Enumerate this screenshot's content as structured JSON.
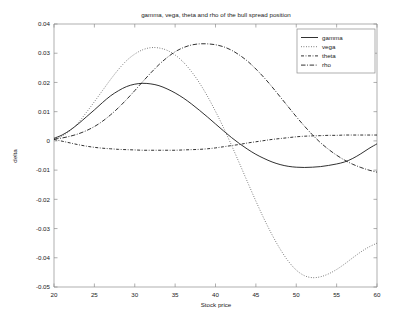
{
  "chart_data": {
    "type": "line",
    "title": "gamma, vega, theta and rho of the bull spread position",
    "xlabel": "Stock price",
    "ylabel": "delta",
    "xlim": [
      20,
      60
    ],
    "ylim": [
      -0.05,
      0.04
    ],
    "xticks": [
      20,
      25,
      30,
      35,
      40,
      45,
      50,
      55,
      60
    ],
    "xticklabels": [
      "20",
      "25",
      "30",
      "35",
      "40",
      "45",
      "50",
      "55",
      "60"
    ],
    "yticks": [
      -0.05,
      -0.04,
      -0.03,
      -0.02,
      -0.01,
      0,
      0.01,
      0.02,
      0.03,
      0.04
    ],
    "yticklabels": [
      "-0.05",
      "-0.04",
      "-0.03",
      "-0.02",
      "-0.01",
      "0",
      "0.01",
      "0.02",
      "0.03",
      "0.04"
    ],
    "grid": false,
    "legend_position": "upper right",
    "x": [
      20,
      21,
      22,
      23,
      24,
      25,
      26,
      27,
      28,
      29,
      30,
      31,
      32,
      33,
      34,
      35,
      36,
      37,
      38,
      39,
      40,
      41,
      42,
      43,
      44,
      45,
      46,
      47,
      48,
      49,
      50,
      51,
      52,
      53,
      54,
      55,
      56,
      57,
      58,
      59,
      60
    ],
    "series": [
      {
        "name": "gamma",
        "style": "solid",
        "color": "#1a1a1a",
        "values": [
          0.0009,
          0.002,
          0.0037,
          0.0058,
          0.0082,
          0.0106,
          0.0131,
          0.0154,
          0.0172,
          0.0186,
          0.0194,
          0.0197,
          0.0195,
          0.0189,
          0.0178,
          0.0164,
          0.0147,
          0.0127,
          0.0105,
          0.0082,
          0.0058,
          0.0034,
          0.0011,
          -0.001,
          -0.0029,
          -0.0046,
          -0.006,
          -0.0072,
          -0.0081,
          -0.0087,
          -0.009,
          -0.0091,
          -0.009,
          -0.0088,
          -0.0084,
          -0.0079,
          -0.0072,
          -0.006,
          -0.0044,
          -0.0026,
          -0.001
        ]
      },
      {
        "name": "vega",
        "style": "dotted",
        "color": "#4d4d4d",
        "values": [
          0.0006,
          0.0017,
          0.0035,
          0.0062,
          0.0097,
          0.0134,
          0.0172,
          0.021,
          0.0245,
          0.0275,
          0.0297,
          0.0312,
          0.0319,
          0.0318,
          0.031,
          0.0294,
          0.027,
          0.0238,
          0.0199,
          0.0153,
          0.0101,
          0.0045,
          -0.0016,
          -0.0079,
          -0.0143,
          -0.0206,
          -0.0266,
          -0.0321,
          -0.037,
          -0.0411,
          -0.0442,
          -0.0461,
          -0.0468,
          -0.0465,
          -0.0455,
          -0.044,
          -0.0421,
          -0.04,
          -0.038,
          -0.0363,
          -0.035
        ]
      },
      {
        "name": "theta",
        "style": "dashdot-short",
        "color": "#1a1a1a",
        "values": [
          0.0005,
          -0.0001,
          -0.0007,
          -0.0013,
          -0.0018,
          -0.0022,
          -0.0025,
          -0.0027,
          -0.0029,
          -0.003,
          -0.0031,
          -0.0032,
          -0.0032,
          -0.0032,
          -0.0032,
          -0.0032,
          -0.0031,
          -0.003,
          -0.0029,
          -0.0027,
          -0.0024,
          -0.002,
          -0.0016,
          -0.0012,
          -0.0007,
          -0.0003,
          0.0001,
          0.0005,
          0.0008,
          0.0011,
          0.0014,
          0.0016,
          0.0017,
          0.0018,
          0.0019,
          0.0019,
          0.002,
          0.002,
          0.002,
          0.002,
          0.002
        ]
      },
      {
        "name": "rho",
        "style": "dashdot-long",
        "color": "#1a1a1a",
        "values": [
          0.0006,
          0.001,
          0.0016,
          0.0024,
          0.0035,
          0.0049,
          0.0067,
          0.0089,
          0.0114,
          0.0142,
          0.0172,
          0.0203,
          0.0233,
          0.0261,
          0.0285,
          0.0305,
          0.0319,
          0.0328,
          0.0332,
          0.0332,
          0.0329,
          0.0322,
          0.031,
          0.0293,
          0.0272,
          0.0246,
          0.0217,
          0.0185,
          0.0151,
          0.0117,
          0.0083,
          0.0051,
          0.0021,
          -0.0006,
          -0.0029,
          -0.0049,
          -0.0066,
          -0.008,
          -0.0091,
          -0.01,
          -0.0107
        ]
      }
    ]
  },
  "legend": {
    "items": [
      {
        "label": "gamma"
      },
      {
        "label": "vega"
      },
      {
        "label": "theta"
      },
      {
        "label": "rho"
      }
    ]
  }
}
